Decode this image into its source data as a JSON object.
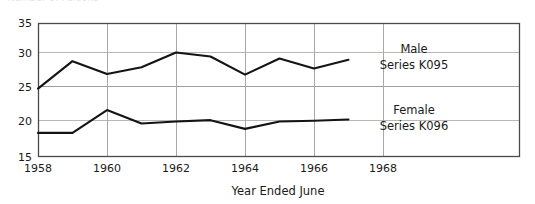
{
  "clipped_header": "Number of Persons",
  "chart_data": {
    "type": "line",
    "title": "",
    "xlabel": "Year Ended June",
    "ylabel": "",
    "xlim": [
      1958,
      1969
    ],
    "ylim": [
      15,
      35
    ],
    "ytick_labels": [
      "35",
      "30",
      "25",
      "20",
      "15"
    ],
    "ytick_values": [
      35,
      30,
      25,
      20,
      15
    ],
    "xtick_labels": [
      "1958",
      "1960",
      "1962",
      "1964",
      "1966",
      "1968"
    ],
    "xtick_values": [
      1958,
      1960,
      1962,
      1964,
      1966,
      1968
    ],
    "grid": "both",
    "legend_position": "inline-right",
    "x": [
      1958,
      1959,
      1960,
      1961,
      1962,
      1963,
      1964,
      1965,
      1966,
      1967
    ],
    "series": [
      {
        "name": "Male",
        "code": "Series K095",
        "color": "#141414",
        "values": [
          25.2,
          29.3,
          27.4,
          28.4,
          30.6,
          30.0,
          27.3,
          29.7,
          28.2,
          29.5
        ]
      },
      {
        "name": "Female",
        "code": "Series K096",
        "color": "#141414",
        "values": [
          18.6,
          18.6,
          22.0,
          20.0,
          20.3,
          20.5,
          19.2,
          20.3,
          20.4,
          20.6
        ]
      }
    ]
  },
  "labels": {
    "male_name": "Male",
    "male_code": "Series K095",
    "female_name": "Female",
    "female_code": "Series K096",
    "x_axis_title": "Year Ended June"
  },
  "colors": {
    "line": "#141414",
    "grid": "#b8b8b8",
    "frame": "#4a4a4a",
    "background": "#ffffff",
    "text": "#1a1a1a"
  }
}
